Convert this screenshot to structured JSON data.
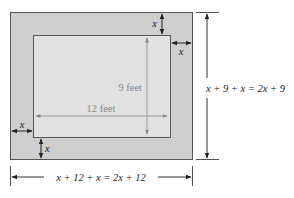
{
  "diagram": {
    "type": "framed-rectangle-dimension-diagram",
    "colors": {
      "border_fill": "#cfcfcf",
      "inner_fill": "#e2e2e2",
      "outline": "#555555",
      "inner_arrow": "#999999",
      "dimension_line": "#333333"
    },
    "inner_rectangle": {
      "width_label": "12 feet",
      "height_label": "9 feet"
    },
    "border": {
      "top_label": "x",
      "right_label": "x",
      "left_label": "x",
      "bottom_label": "x"
    },
    "total_height_label": "x + 9 + x = 2x + 9",
    "total_width_label": "x + 12 + x = 2x + 12"
  }
}
